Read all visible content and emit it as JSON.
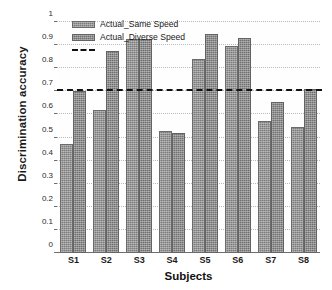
{
  "chart_data": {
    "type": "bar",
    "title": "",
    "xlabel": "Subjects",
    "ylabel": "Discrimination accuracy",
    "categories": [
      "S1",
      "S2",
      "S3",
      "S4",
      "S5",
      "S6",
      "S7",
      "S8"
    ],
    "series": [
      {
        "name": "Actual_Same Speed",
        "values": [
          0.47,
          0.62,
          0.925,
          0.53,
          0.84,
          0.895,
          0.57,
          0.545
        ]
      },
      {
        "name": "Actual_Diverse Speed",
        "values": [
          0.7,
          0.875,
          0.925,
          0.52,
          0.95,
          0.93,
          0.655,
          0.71
        ]
      }
    ],
    "ylim": [
      0,
      1
    ],
    "yticks": [
      "0",
      "0.1",
      "0.2",
      "0.3",
      "0.4",
      "0.5",
      "0.6",
      "0.7",
      "0.8",
      "0.9",
      "1"
    ],
    "ytick_values": [
      0,
      0.1,
      0.2,
      0.3,
      0.4,
      0.5,
      0.6,
      0.7,
      0.8,
      0.9,
      1
    ],
    "grid": true,
    "legend_position": "top-left",
    "annotations": [
      {
        "type": "hline",
        "label": "",
        "value": 0.7,
        "style": "dashed",
        "color": "#111111"
      }
    ],
    "legend_entries": [
      {
        "label": "Actual_Same Speed",
        "swatch": "bar",
        "color": "#7b7b7b"
      },
      {
        "label": "Actual_Diverse Speed",
        "swatch": "bar",
        "color": "#6f6f6f"
      },
      {
        "label": "",
        "swatch": "dashed",
        "color": "#111111"
      }
    ]
  },
  "colors": {
    "series_1": "#7b7b7b",
    "series_2": "#6f6f6f",
    "threshold": "#111111",
    "grid": "#b9b9b9",
    "axis": "#6e6e6e",
    "background": "#ffffff"
  }
}
